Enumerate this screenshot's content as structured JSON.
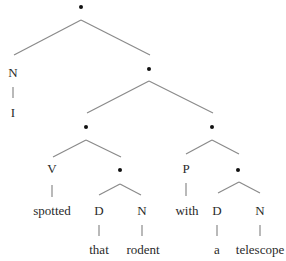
{
  "diagram": {
    "type": "syntax-tree",
    "sentence": "I spotted that rodent with a telescope",
    "colors": {
      "line": "#8a8a8a",
      "text": "#2a2a2a",
      "node": "#111111"
    },
    "nodes": [
      {
        "id": "root",
        "kind": "dot",
        "x": 81,
        "y": 7
      },
      {
        "id": "n1",
        "kind": "label",
        "label": "N",
        "x": 13,
        "y": 72
      },
      {
        "id": "w_I",
        "kind": "word",
        "label": "I",
        "x": 13,
        "y": 112
      },
      {
        "id": "d1",
        "kind": "dot",
        "x": 149,
        "y": 69
      },
      {
        "id": "d2",
        "kind": "dot",
        "x": 86,
        "y": 127
      },
      {
        "id": "d3",
        "kind": "dot",
        "x": 212,
        "y": 127
      },
      {
        "id": "v",
        "kind": "label",
        "label": "V",
        "x": 52,
        "y": 168
      },
      {
        "id": "w_spotted",
        "kind": "word",
        "label": "spotted",
        "x": 52,
        "y": 210
      },
      {
        "id": "d4",
        "kind": "dot",
        "x": 120,
        "y": 170
      },
      {
        "id": "det1",
        "kind": "label",
        "label": "D",
        "x": 99,
        "y": 210
      },
      {
        "id": "n2",
        "kind": "label",
        "label": "N",
        "x": 142,
        "y": 210
      },
      {
        "id": "w_that",
        "kind": "word",
        "label": "that",
        "x": 99,
        "y": 249
      },
      {
        "id": "w_rodent",
        "kind": "word",
        "label": "rodent",
        "x": 143,
        "y": 249
      },
      {
        "id": "p",
        "kind": "label",
        "label": "P",
        "x": 186,
        "y": 168
      },
      {
        "id": "w_with",
        "kind": "word",
        "label": "with",
        "x": 187,
        "y": 210
      },
      {
        "id": "d5",
        "kind": "dot",
        "x": 238,
        "y": 170
      },
      {
        "id": "det2",
        "kind": "label",
        "label": "D",
        "x": 217,
        "y": 210
      },
      {
        "id": "n3",
        "kind": "label",
        "label": "N",
        "x": 260,
        "y": 210
      },
      {
        "id": "w_a",
        "kind": "word",
        "label": "a",
        "x": 217,
        "y": 249
      },
      {
        "id": "w_telescope",
        "kind": "word",
        "label": "telescope",
        "x": 260,
        "y": 249
      }
    ],
    "edges": [
      {
        "x1": 81,
        "y1": 20,
        "x2": 14,
        "y2": 55
      },
      {
        "x1": 81,
        "y1": 20,
        "x2": 150,
        "y2": 55
      },
      {
        "x1": 13,
        "y1": 87,
        "x2": 13,
        "y2": 98
      },
      {
        "x1": 149,
        "y1": 81,
        "x2": 87,
        "y2": 113
      },
      {
        "x1": 149,
        "y1": 81,
        "x2": 213,
        "y2": 113
      },
      {
        "x1": 86,
        "y1": 140,
        "x2": 53,
        "y2": 157
      },
      {
        "x1": 86,
        "y1": 140,
        "x2": 121,
        "y2": 157
      },
      {
        "x1": 52,
        "y1": 185,
        "x2": 52,
        "y2": 197
      },
      {
        "x1": 120,
        "y1": 184,
        "x2": 99,
        "y2": 195
      },
      {
        "x1": 120,
        "y1": 184,
        "x2": 141,
        "y2": 195
      },
      {
        "x1": 99,
        "y1": 225,
        "x2": 99,
        "y2": 236
      },
      {
        "x1": 142,
        "y1": 225,
        "x2": 142,
        "y2": 236
      },
      {
        "x1": 212,
        "y1": 140,
        "x2": 186,
        "y2": 154
      },
      {
        "x1": 212,
        "y1": 140,
        "x2": 239,
        "y2": 154
      },
      {
        "x1": 186,
        "y1": 183,
        "x2": 186,
        "y2": 196
      },
      {
        "x1": 239,
        "y1": 182,
        "x2": 218,
        "y2": 193
      },
      {
        "x1": 239,
        "y1": 182,
        "x2": 260,
        "y2": 193
      },
      {
        "x1": 217,
        "y1": 225,
        "x2": 217,
        "y2": 236
      },
      {
        "x1": 260,
        "y1": 225,
        "x2": 260,
        "y2": 236
      }
    ]
  }
}
